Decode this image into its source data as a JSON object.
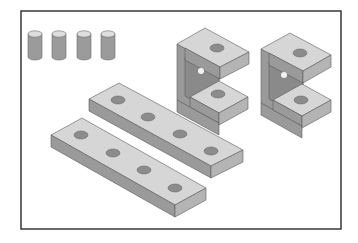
{
  "figure": {
    "title": "",
    "colors": {
      "frame": "#2a2a2a",
      "top_face": "#d6d6d6",
      "front_face": "#9a9a9a",
      "side_face": "#b4b4b4",
      "hole": "#8c8c8c"
    }
  },
  "parts": {
    "pins": {
      "count": 4,
      "label": "pin"
    },
    "brackets": {
      "count": 2,
      "label": "c-bracket",
      "holes_each": 2
    },
    "bars": {
      "count": 2,
      "label": "flat-bar",
      "holes_each": 4
    }
  }
}
